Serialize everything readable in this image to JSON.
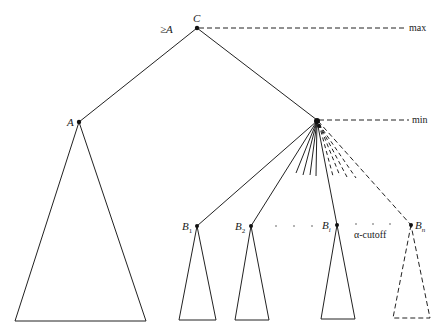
{
  "diagram": {
    "levels": {
      "max_label": "max",
      "min_label": "min"
    },
    "nodes": {
      "root": {
        "label": "C",
        "bound_label": "≥A",
        "level": "max"
      },
      "left_child": {
        "label": "A"
      },
      "right_child": {
        "label": "",
        "level": "min"
      },
      "b_children": [
        {
          "label": "B",
          "sub": "1",
          "pruned": false
        },
        {
          "label": "B",
          "sub": "2",
          "pruned": false
        },
        {
          "label": "B",
          "sub": "i",
          "pruned": false
        },
        {
          "label": "B",
          "sub": "n",
          "pruned": true
        }
      ]
    },
    "annotations": {
      "cutoff_label": "α-cutoff",
      "ellipsis": "· · ·"
    },
    "colors": {
      "line": "#222222",
      "background": "#ffffff"
    }
  }
}
